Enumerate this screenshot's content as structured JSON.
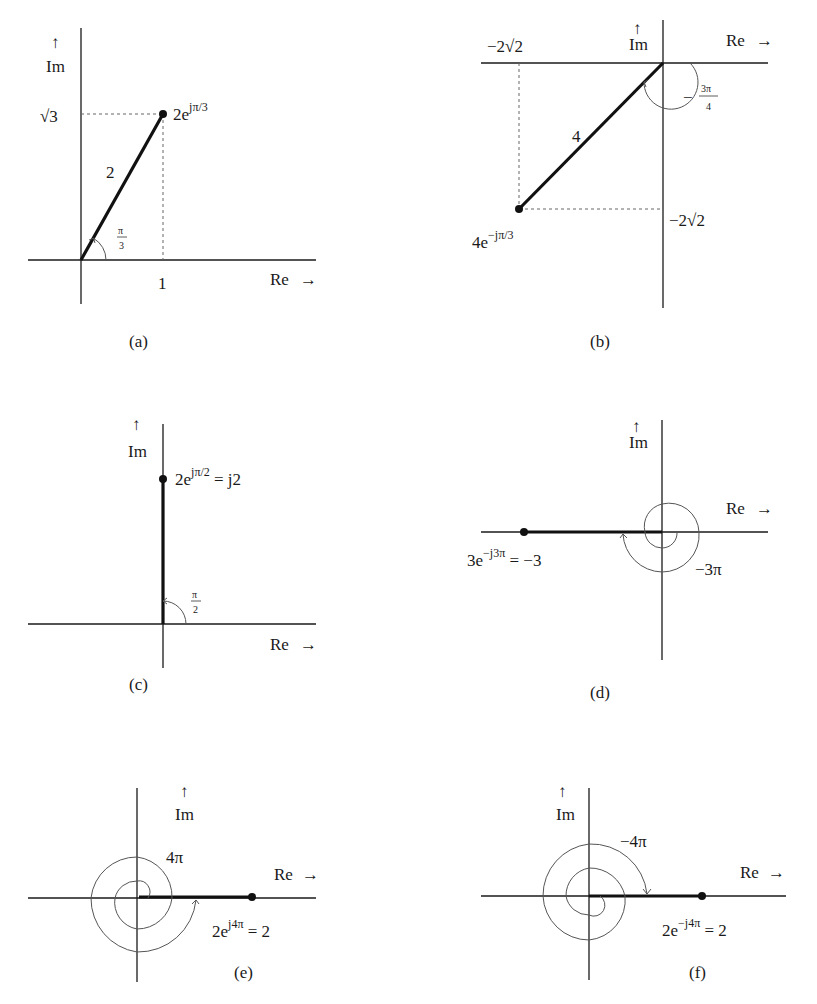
{
  "figure": {
    "axis_labels": {
      "im": "Im",
      "re": "Re",
      "up_arrow": "↑",
      "right_arrow": "→"
    },
    "panels": [
      {
        "id": "a",
        "caption": "(a)",
        "origin": [
          81,
          260
        ],
        "point": [
          163,
          114
        ],
        "point_label_base": "2e",
        "point_label_exp": "jπ/3",
        "point_label_suffix": "",
        "magnitude_label": "2",
        "angle_label_num": "π",
        "angle_label_den": "3",
        "real_tick": "1",
        "imag_tick": "√3"
      },
      {
        "id": "b",
        "caption": "(b)",
        "origin": [
          663,
          63
        ],
        "point": [
          519,
          209
        ],
        "point_label_base": "4e",
        "point_label_exp": "−jπ/3",
        "point_label_suffix": "",
        "magnitude_label": "4",
        "angle_label_prefix": "−",
        "angle_label_num": "3π",
        "angle_label_den": "4",
        "real_tick": "−2√2",
        "imag_tick": "−2√2"
      },
      {
        "id": "c",
        "caption": "(c)",
        "origin": [
          163,
          624
        ],
        "point": [
          163,
          479
        ],
        "point_label_base": "2e",
        "point_label_exp": "jπ/2",
        "point_label_suffix": " = j2",
        "angle_label_num": "π",
        "angle_label_den": "2"
      },
      {
        "id": "d",
        "caption": "(d)",
        "origin": [
          662,
          532
        ],
        "point": [
          524,
          532
        ],
        "point_label_base": "3e",
        "point_label_exp": "−j3π",
        "point_label_suffix": " = −3",
        "angle_label": "−3π"
      },
      {
        "id": "e",
        "caption": "(e)",
        "origin": [
          137,
          898
        ],
        "point": [
          252,
          897
        ],
        "point_label_base": "2e",
        "point_label_exp": "j4π",
        "point_label_suffix": " = 2",
        "angle_label": "4π"
      },
      {
        "id": "f",
        "caption": "(f)",
        "origin": [
          589,
          896
        ],
        "point": [
          702,
          896
        ],
        "point_label_base": "2e",
        "point_label_exp": "−j4π",
        "point_label_suffix": " = 2",
        "angle_label": "−4π"
      }
    ]
  }
}
